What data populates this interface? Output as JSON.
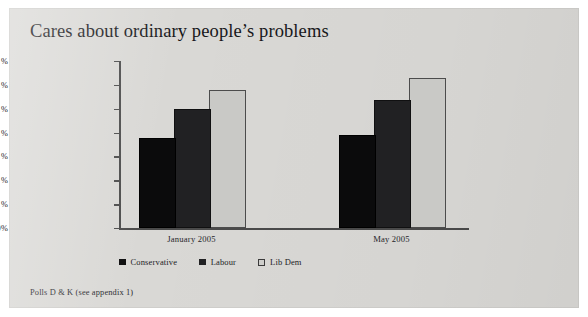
{
  "figure": {
    "title": "Cares about ordinary people’s problems",
    "footnote": "Polls D & K (see appendix 1)",
    "background_color": "#d9d8d5"
  },
  "chart_data": {
    "type": "bar",
    "title": "Cares about ordinary people’s problems",
    "xlabel": "",
    "ylabel": "",
    "ylim": [
      0,
      70
    ],
    "grid": false,
    "legend_position": "bottom",
    "categories": [
      "January 2005",
      "May 2005"
    ],
    "y_ticks": [
      0,
      10,
      20,
      30,
      40,
      50,
      60,
      70
    ],
    "y_tick_labels": [
      "0%",
      "10 %",
      "20 %",
      "30 %",
      "40 %",
      "50 %",
      "60 %",
      "70 %"
    ],
    "series": [
      {
        "name": "Conservative",
        "color": "#0b0b0c",
        "values": [
          37,
          38
        ]
      },
      {
        "name": "Labour",
        "color": "#212123",
        "values": [
          49,
          53
        ]
      },
      {
        "name": "Lib Dem",
        "color": "#c9c9c6",
        "values": [
          57,
          62
        ]
      }
    ],
    "annotations": [
      "Polls D & K (see appendix 1)"
    ]
  }
}
